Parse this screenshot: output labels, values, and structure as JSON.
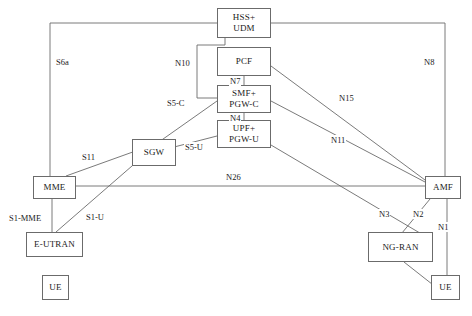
{
  "diagram": {
    "caption": "",
    "stroke_color": "#6b6b6b",
    "text_color": "#1a1a1a",
    "background": "#ffffff",
    "nodes": [
      {
        "id": "hss_udm",
        "label_line1": "HSS+",
        "label_line2": "UDM",
        "x": 217,
        "y": 8,
        "w": 54,
        "h": 30
      },
      {
        "id": "pcf",
        "label_line1": "PCF",
        "label_line2": "",
        "x": 217,
        "y": 47,
        "w": 54,
        "h": 29
      },
      {
        "id": "smf_pgwc",
        "label_line1": "SMF+",
        "label_line2": "PGW-C",
        "x": 217,
        "y": 85,
        "w": 54,
        "h": 28
      },
      {
        "id": "upf_pgwu",
        "label_line1": "UPF+",
        "label_line2": "PGW-U",
        "x": 217,
        "y": 120,
        "w": 54,
        "h": 28
      },
      {
        "id": "sgw",
        "label_line1": "SGW",
        "label_line2": "",
        "x": 132,
        "y": 139,
        "w": 44,
        "h": 27
      },
      {
        "id": "mme",
        "label_line1": "MME",
        "label_line2": "",
        "x": 33,
        "y": 176,
        "w": 43,
        "h": 23
      },
      {
        "id": "eutran",
        "label_line1": "E-UTRAN",
        "label_line2": "",
        "x": 26,
        "y": 232,
        "w": 57,
        "h": 25
      },
      {
        "id": "ue_left",
        "label_line1": "UE",
        "label_line2": "",
        "x": 42,
        "y": 275,
        "w": 27,
        "h": 25
      },
      {
        "id": "amf",
        "label_line1": "AMF",
        "label_line2": "",
        "x": 425,
        "y": 176,
        "w": 36,
        "h": 23
      },
      {
        "id": "ngran",
        "label_line1": "NG-RAN",
        "label_line2": "",
        "x": 368,
        "y": 232,
        "w": 65,
        "h": 30
      },
      {
        "id": "ue_right",
        "label_line1": "UE",
        "label_line2": "",
        "x": 431,
        "y": 275,
        "w": 29,
        "h": 25
      }
    ],
    "edge_labels": [
      {
        "id": "s6a",
        "text": "S6a",
        "x": 55,
        "y": 57
      },
      {
        "id": "n8",
        "text": "N8",
        "x": 423,
        "y": 57
      },
      {
        "id": "n10",
        "text": "N10",
        "x": 174,
        "y": 58
      },
      {
        "id": "n7",
        "text": "N7",
        "x": 229,
        "y": 76
      },
      {
        "id": "n4",
        "text": "N4",
        "x": 229,
        "y": 113
      },
      {
        "id": "n15",
        "text": "N15",
        "x": 338,
        "y": 93
      },
      {
        "id": "n11",
        "text": "N11",
        "x": 330,
        "y": 135
      },
      {
        "id": "s5c",
        "text": "S5-C",
        "x": 166,
        "y": 98
      },
      {
        "id": "s5u",
        "text": "S5-U",
        "x": 184,
        "y": 142
      },
      {
        "id": "s11",
        "text": "S11",
        "x": 81,
        "y": 152
      },
      {
        "id": "n26",
        "text": "N26",
        "x": 225,
        "y": 172
      },
      {
        "id": "s1mme",
        "text": "S1-MME",
        "x": 8,
        "y": 213
      },
      {
        "id": "s1u",
        "text": "S1-U",
        "x": 85,
        "y": 212
      },
      {
        "id": "n3",
        "text": "N3",
        "x": 378,
        "y": 209
      },
      {
        "id": "n2",
        "text": "N2",
        "x": 412,
        "y": 209
      },
      {
        "id": "n1",
        "text": "N1",
        "x": 437,
        "y": 222
      }
    ],
    "edges": [
      {
        "id": "edge-s6a",
        "label": "S6a",
        "path": "M 50 199 L 50 23 L 217 23"
      },
      {
        "id": "edge-n8",
        "label": "N8",
        "path": "M 271 23 L 445 23 L 445 176"
      },
      {
        "id": "edge-n10",
        "label": "N10",
        "path": "M 225 38 L 225 45 L 197 45 L 197 98 L 217 98"
      },
      {
        "id": "edge-n7",
        "label": "N7",
        "path": "M 244 76 L 244 85"
      },
      {
        "id": "edge-n4",
        "label": "N4",
        "path": "M 244 113 L 244 120"
      },
      {
        "id": "edge-n15",
        "label": "N15",
        "path": "M 271 66 L 425 180"
      },
      {
        "id": "edge-n11",
        "label": "N11",
        "path": "M 271 101 L 425 182"
      },
      {
        "id": "edge-s5c",
        "label": "S5-C",
        "path": "M 217 101 L 139 156"
      },
      {
        "id": "edge-s5u",
        "label": "S5-U",
        "path": "M 217 136 L 139 156"
      },
      {
        "id": "edge-s11",
        "label": "S11",
        "path": "M 66 176 L 155 144"
      },
      {
        "id": "edge-n26",
        "label": "N26",
        "path": "M 76 186 L 425 186"
      },
      {
        "id": "edge-s1mme",
        "label": "S1-MME",
        "path": "M 52 199 L 52 232"
      },
      {
        "id": "edge-s1u",
        "label": "S1-U",
        "path": "M 56 232 L 155 146"
      },
      {
        "id": "edge-n3",
        "label": "N3",
        "path": "M 271 145 L 430 239"
      },
      {
        "id": "edge-n2",
        "label": "N2",
        "path": "M 430 199 L 397 239"
      },
      {
        "id": "edge-n1",
        "label": "N1",
        "path": "M 447 199 L 447 283"
      },
      {
        "id": "edge-ngran-ue",
        "label": "",
        "path": "M 404 262 L 437 288"
      }
    ]
  }
}
